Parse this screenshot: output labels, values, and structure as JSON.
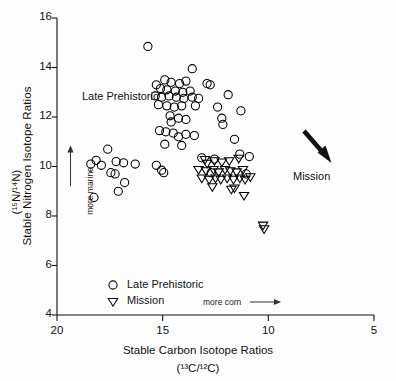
{
  "figure": {
    "title": "",
    "background": "#ffffff",
    "ink": "#000000"
  },
  "axes": {
    "y_title_main": "Stable Nitrogen Isotope Ratios",
    "y_title_sub": "(¹⁵N/¹⁴N)",
    "x_title_main": "Stable Carbon Isotope Ratios",
    "x_title_sub": "(¹³C/¹²C)"
  },
  "annotations": {
    "late_prehistoric": "Late Prehistoric",
    "mission": "Mission",
    "more_marine": "more marine",
    "more_corn": "more corn"
  },
  "legend": {
    "items": [
      {
        "marker": "circle",
        "label": "Late Prehistoric"
      },
      {
        "marker": "triangle-down",
        "label": "Mission"
      }
    ]
  },
  "chart_data": {
    "type": "scatter",
    "title": "",
    "xlabel": "Stable Carbon Isotope Ratios (13C/12C)",
    "ylabel": "Stable Nitrogen Isotope Ratios (15N/14N)",
    "xlim": [
      20,
      5
    ],
    "ylim": [
      4,
      16
    ],
    "x_ticks": [
      20,
      15,
      10,
      5
    ],
    "y_ticks": [
      4,
      6,
      8,
      10,
      12,
      14,
      16
    ],
    "x_axis_inverted": true,
    "grid": false,
    "legend_position": "lower-left",
    "series": [
      {
        "name": "Late Prehistoric",
        "marker": "circle",
        "color": "#000000",
        "points": [
          [
            15.7,
            14.85
          ],
          [
            13.6,
            13.95
          ],
          [
            14.9,
            13.5
          ],
          [
            14.6,
            13.4
          ],
          [
            14.2,
            13.35
          ],
          [
            13.9,
            13.45
          ],
          [
            15.3,
            13.3
          ],
          [
            15.1,
            13.15
          ],
          [
            14.8,
            13.1
          ],
          [
            14.4,
            13.05
          ],
          [
            14.05,
            13.0
          ],
          [
            13.7,
            13.05
          ],
          [
            12.9,
            13.35
          ],
          [
            12.75,
            13.3
          ],
          [
            15.35,
            12.85
          ],
          [
            15.05,
            12.8
          ],
          [
            14.7,
            12.85
          ],
          [
            14.35,
            12.8
          ],
          [
            14.0,
            12.75
          ],
          [
            13.6,
            12.8
          ],
          [
            13.3,
            12.75
          ],
          [
            11.9,
            12.9
          ],
          [
            15.2,
            12.5
          ],
          [
            14.8,
            12.45
          ],
          [
            14.45,
            12.4
          ],
          [
            14.1,
            12.45
          ],
          [
            13.45,
            12.45
          ],
          [
            12.4,
            12.4
          ],
          [
            11.3,
            12.25
          ],
          [
            14.65,
            12.05
          ],
          [
            14.6,
            11.8
          ],
          [
            14.25,
            11.95
          ],
          [
            13.9,
            11.9
          ],
          [
            12.2,
            11.95
          ],
          [
            12.15,
            11.7
          ],
          [
            15.15,
            11.45
          ],
          [
            14.85,
            11.4
          ],
          [
            14.5,
            11.35
          ],
          [
            14.25,
            11.2
          ],
          [
            13.9,
            11.3
          ],
          [
            13.5,
            11.25
          ],
          [
            11.6,
            11.1
          ],
          [
            14.9,
            10.9
          ],
          [
            14.1,
            10.85
          ],
          [
            17.6,
            10.7
          ],
          [
            18.15,
            10.25
          ],
          [
            18.4,
            10.1
          ],
          [
            17.9,
            10.05
          ],
          [
            17.2,
            10.2
          ],
          [
            16.85,
            10.15
          ],
          [
            16.3,
            10.1
          ],
          [
            15.3,
            10.05
          ],
          [
            13.15,
            10.35
          ],
          [
            12.55,
            10.3
          ],
          [
            11.35,
            10.5
          ],
          [
            10.9,
            10.4
          ],
          [
            17.45,
            9.75
          ],
          [
            17.25,
            9.7
          ],
          [
            15.05,
            9.85
          ],
          [
            14.95,
            9.75
          ],
          [
            12.7,
            9.75
          ],
          [
            11.05,
            9.7
          ],
          [
            16.8,
            9.35
          ],
          [
            18.25,
            8.75
          ],
          [
            17.1,
            9.0
          ]
        ]
      },
      {
        "name": "Mission",
        "marker": "triangle-down",
        "color": "#000000",
        "points": [
          [
            13.0,
            10.25
          ],
          [
            12.9,
            10.1
          ],
          [
            12.55,
            10.2
          ],
          [
            12.2,
            10.15
          ],
          [
            11.85,
            10.2
          ],
          [
            11.4,
            10.3
          ],
          [
            13.3,
            9.85
          ],
          [
            12.95,
            9.8
          ],
          [
            12.6,
            9.85
          ],
          [
            12.35,
            9.75
          ],
          [
            12.05,
            9.85
          ],
          [
            11.8,
            9.8
          ],
          [
            11.5,
            9.75
          ],
          [
            11.2,
            9.85
          ],
          [
            13.15,
            9.5
          ],
          [
            12.8,
            9.45
          ],
          [
            12.5,
            9.5
          ],
          [
            12.25,
            9.45
          ],
          [
            11.95,
            9.5
          ],
          [
            11.65,
            9.45
          ],
          [
            11.35,
            9.5
          ],
          [
            11.1,
            9.45
          ],
          [
            10.85,
            9.55
          ],
          [
            12.65,
            9.15
          ],
          [
            11.75,
            9.05
          ],
          [
            11.6,
            9.1
          ],
          [
            11.15,
            8.8
          ],
          [
            10.25,
            7.6
          ],
          [
            10.2,
            7.45
          ]
        ]
      }
    ]
  }
}
